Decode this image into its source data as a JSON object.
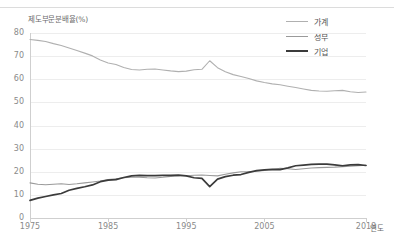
{
  "chart_data": {
    "type": "line",
    "title": "",
    "ylabel": "제도부문분배율(%)",
    "xlabel": "연도",
    "ylim": [
      0,
      80
    ],
    "xlim": [
      1975,
      2018
    ],
    "yticks": [
      0,
      10,
      20,
      30,
      40,
      50,
      60,
      70,
      80
    ],
    "xticks": [
      1975,
      1985,
      1995,
      2005,
      2018
    ],
    "grid": true,
    "legend_position": "top-right",
    "x": [
      1975,
      1976,
      1977,
      1978,
      1979,
      1980,
      1981,
      1982,
      1983,
      1984,
      1985,
      1986,
      1987,
      1988,
      1989,
      1990,
      1991,
      1992,
      1993,
      1994,
      1995,
      1996,
      1997,
      1998,
      1999,
      2000,
      2001,
      2002,
      2003,
      2004,
      2005,
      2006,
      2007,
      2008,
      2009,
      2010,
      2011,
      2012,
      2013,
      2014,
      2015,
      2016,
      2017,
      2018
    ],
    "series": [
      {
        "name": "가계",
        "color": "#b0b0b0",
        "values": [
          77.2,
          76.8,
          76.3,
          75.4,
          74.6,
          73.5,
          72.4,
          71.3,
          70.1,
          68.3,
          67.0,
          66.4,
          65.1,
          64.2,
          64.0,
          64.3,
          64.4,
          64.0,
          63.6,
          63.3,
          63.5,
          64.1,
          64.3,
          68.0,
          65.0,
          63.2,
          62.0,
          61.2,
          60.3,
          59.3,
          58.6,
          58.0,
          57.6,
          57.0,
          56.4,
          55.8,
          55.2,
          54.9,
          54.8,
          55.0,
          55.2,
          54.6,
          54.3,
          54.5
        ]
      },
      {
        "name": "정부",
        "color": "#9a9a9a",
        "values": [
          15.2,
          14.6,
          14.4,
          14.6,
          14.8,
          14.5,
          14.8,
          15.2,
          15.6,
          16.0,
          16.6,
          17.0,
          17.4,
          17.6,
          17.6,
          17.4,
          17.3,
          17.6,
          18.0,
          18.1,
          18.3,
          18.5,
          18.6,
          18.4,
          18.2,
          18.9,
          19.5,
          20.0,
          20.0,
          20.2,
          20.6,
          21.0,
          21.5,
          21.3,
          21.0,
          21.3,
          21.6,
          21.8,
          21.9,
          22.0,
          22.2,
          22.4,
          22.6,
          22.8
        ]
      },
      {
        "name": "기업",
        "color": "#3b3b3b",
        "values": [
          7.6,
          8.6,
          9.3,
          10.0,
          10.6,
          12.0,
          12.8,
          13.5,
          14.3,
          15.7,
          16.4,
          16.6,
          17.5,
          18.2,
          18.4,
          18.3,
          18.3,
          18.4,
          18.4,
          18.6,
          18.2,
          17.4,
          17.1,
          13.6,
          16.8,
          17.9,
          18.5,
          18.8,
          19.7,
          20.5,
          20.8,
          21.0,
          20.9,
          21.7,
          22.6,
          22.9,
          23.2,
          23.3,
          23.3,
          23.0,
          22.6,
          23.0,
          23.1,
          22.7
        ]
      }
    ]
  }
}
